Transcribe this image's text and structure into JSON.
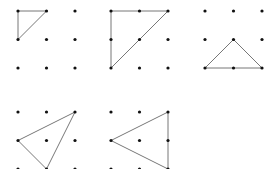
{
  "diagram": {
    "grid_size": 3,
    "colors": {
      "dot": "#111111",
      "edge": "#777777",
      "background": "#ffffff"
    },
    "panels": [
      {
        "id": "panel-1",
        "origin": [
          18,
          11
        ],
        "spacing": 28.5,
        "triangle": [
          [
            0,
            0
          ],
          [
            1,
            0
          ],
          [
            0,
            1
          ]
        ]
      },
      {
        "id": "panel-2",
        "origin": [
          111,
          11
        ],
        "spacing": 28.5,
        "triangle": [
          [
            0,
            0
          ],
          [
            2,
            0
          ],
          [
            0,
            2
          ]
        ]
      },
      {
        "id": "panel-3",
        "origin": [
          205,
          11
        ],
        "spacing": 28.5,
        "triangle": [
          [
            1,
            1
          ],
          [
            0,
            2
          ],
          [
            2,
            2
          ]
        ]
      },
      {
        "id": "panel-4",
        "origin": [
          18,
          112
        ],
        "spacing": 28.5,
        "triangle": [
          [
            2,
            0
          ],
          [
            0,
            1
          ],
          [
            1,
            2
          ]
        ]
      },
      {
        "id": "panel-5",
        "origin": [
          111,
          112
        ],
        "spacing": 28.5,
        "triangle": [
          [
            2,
            0
          ],
          [
            0,
            1
          ],
          [
            2,
            2
          ]
        ]
      }
    ]
  }
}
